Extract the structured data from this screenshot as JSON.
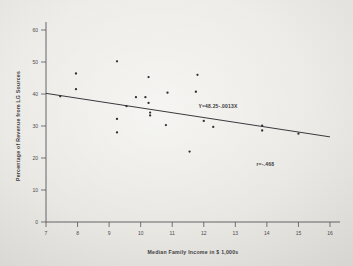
{
  "figure": {
    "background_color": "#ecebe7",
    "ink_color": "#3a393d"
  },
  "chart_data": {
    "type": "scatter",
    "title": "",
    "xlabel": "Median Family Income in $ 1,000s",
    "ylabel": "Percentage of Revenue from LG Sources",
    "xlim": [
      7,
      16
    ],
    "ylim": [
      0,
      60
    ],
    "xticks": [
      7,
      8,
      9,
      10,
      11,
      12,
      13,
      14,
      15,
      16
    ],
    "yticks": [
      0,
      10,
      20,
      30,
      40,
      50,
      60
    ],
    "xtick_labels": [
      "7",
      "8",
      "9",
      "10",
      "11",
      "12",
      "13",
      "14",
      "15",
      "16"
    ],
    "ytick_labels": [
      "0",
      "10",
      "20",
      "30",
      "40",
      "50",
      "60"
    ],
    "grid": false,
    "legend": null,
    "points": [
      {
        "x": 7.45,
        "y": 39.3
      },
      {
        "x": 7.95,
        "y": 46.4
      },
      {
        "x": 7.95,
        "y": 41.5
      },
      {
        "x": 9.25,
        "y": 50.2
      },
      {
        "x": 9.25,
        "y": 32.2
      },
      {
        "x": 9.25,
        "y": 28.0
      },
      {
        "x": 9.55,
        "y": 36.2
      },
      {
        "x": 9.85,
        "y": 39.0
      },
      {
        "x": 10.15,
        "y": 39.0
      },
      {
        "x": 10.25,
        "y": 45.3
      },
      {
        "x": 10.25,
        "y": 37.2
      },
      {
        "x": 10.3,
        "y": 34.2
      },
      {
        "x": 10.3,
        "y": 33.3
      },
      {
        "x": 10.8,
        "y": 30.3
      },
      {
        "x": 10.85,
        "y": 40.4
      },
      {
        "x": 11.55,
        "y": 22.0
      },
      {
        "x": 11.8,
        "y": 46.0
      },
      {
        "x": 11.75,
        "y": 40.7
      },
      {
        "x": 12.0,
        "y": 31.6
      },
      {
        "x": 12.3,
        "y": 29.7
      },
      {
        "x": 13.85,
        "y": 30.1
      },
      {
        "x": 13.85,
        "y": 28.6
      },
      {
        "x": 15.0,
        "y": 27.6
      }
    ],
    "fit_line": {
      "equation_label": "Y=48.25-.0013X",
      "x_start": 7.0,
      "y_start": 40.2,
      "x_end": 16.0,
      "y_end": 26.6
    },
    "annotations": [
      {
        "name": "regression-equation",
        "text": "Y=48.25-.0013X",
        "x": 12.45,
        "y": 35.6
      },
      {
        "name": "correlation-coefficient",
        "text": "r=-.468",
        "x": 13.95,
        "y": 17.4
      }
    ]
  }
}
